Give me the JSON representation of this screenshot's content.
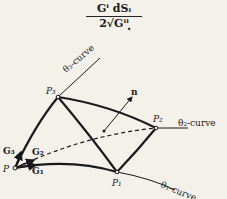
{
  "formula": {
    "numerator": "Gⁱ dSᵢ",
    "denominator": "2√Gⁱⁱ",
    "punctuation": "."
  },
  "diagram": {
    "points": [
      "P",
      "P₁",
      "P₂",
      "P₃"
    ],
    "vectors": [
      "G₁",
      "G₂",
      "G₃",
      "n"
    ],
    "curves": [
      "θ₁-curve",
      "θ₂-curve",
      "θ₃-curve"
    ]
  }
}
